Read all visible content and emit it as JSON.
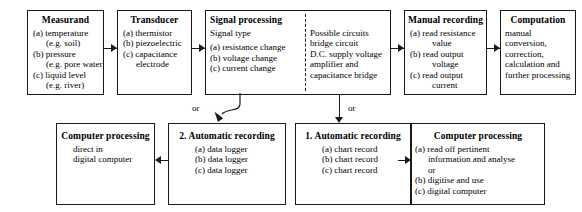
{
  "diagram": {
    "line_color": "#1a1a1a",
    "background": "#ffffff",
    "connector_labels": {
      "or_left": "or",
      "or_right": "or"
    },
    "boxes": {
      "measurand": {
        "title": "Measurand",
        "lines": [
          "(a) temperature",
          "(e.g. soil)",
          "(b) pressure",
          "(e.g. pore water)",
          "(c) liquid level",
          "(e.g. river)"
        ]
      },
      "transducer": {
        "title": "Transducer",
        "lines": [
          "(a) thermistor",
          "(b) piezoelectric",
          "(c) capacitance",
          "electrode"
        ]
      },
      "signal_processing": {
        "title": "Signal processing",
        "subtitle": "Signal type",
        "lines": [
          "(a) resistance change",
          "(b) voltage change",
          "(c) current change"
        ],
        "right_title": "Possible circuits",
        "right_lines": [
          "bridge circuit",
          "D.C. supply voltage",
          "amplifier and",
          "capacitance bridge"
        ]
      },
      "manual_recording": {
        "title": "Manual recording",
        "lines": [
          "(a) read resistance",
          "value",
          "(b) read output",
          "voltage",
          "(c) read output",
          "current"
        ]
      },
      "computation": {
        "title": "Computation",
        "lines": [
          "manual",
          "conversion,",
          "correction,",
          "calculation and",
          "further processing"
        ]
      },
      "computer_processing_left": {
        "title": "Computer processing",
        "lines": [
          "direct in",
          "digital computer"
        ]
      },
      "automatic_recording_2": {
        "title": "2. Automatic recording",
        "lines": [
          "(a) data logger",
          "(b) data logger",
          "(c) data logger"
        ]
      },
      "automatic_recording_1": {
        "title": "1. Automatic recording",
        "lines": [
          "(a) chart record",
          "(b) chart record",
          "(c) chart record"
        ]
      },
      "computer_processing_right": {
        "title": "Computer processing",
        "lines": [
          "(a) read off pertinent",
          "information and analyse",
          "or",
          "(b) digitise and use",
          "(c) digital computer"
        ]
      }
    }
  }
}
